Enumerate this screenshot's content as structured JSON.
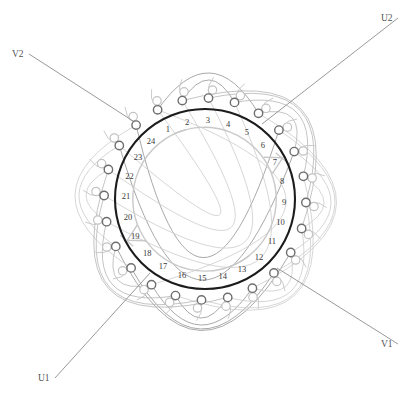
{
  "diagram": {
    "type": "winding-diagram",
    "slot_count": 24,
    "geometry": {
      "center_x": 205,
      "center_y": 199,
      "stator_radius": 90,
      "bore_radius": 72,
      "node_radius_outer": 101,
      "node_dot_r": 4.2
    },
    "colors": {
      "stator_ring": "#1c1c1c",
      "bore_ring": "#c9c9c9",
      "phase_u": "#9a9a9a",
      "phase_v": "#b9b9b9",
      "phase_w": "#cfcfcf",
      "node_dark": "#6e6e6e",
      "node_light": "#c4c4c4",
      "label_text": "#3a3a3a",
      "terminal_text": "#555555",
      "background": "#ffffff"
    },
    "slot_numbers": [
      "1",
      "2",
      "3",
      "4",
      "5",
      "6",
      "7",
      "8",
      "9",
      "10",
      "11",
      "12",
      "13",
      "14",
      "15",
      "16",
      "17",
      "18",
      "19",
      "20",
      "21",
      "22",
      "23",
      "24"
    ],
    "terminals": [
      {
        "id": "V2",
        "label": "V2",
        "x": 12,
        "y": 52,
        "anchor_x": 133,
        "anchor_y": 121,
        "text_anchor": "start"
      },
      {
        "id": "U2",
        "label": "U2",
        "x": 381,
        "y": 16,
        "anchor_x": 262,
        "anchor_y": 124,
        "text_anchor": "start"
      },
      {
        "id": "V1",
        "label": "V1",
        "x": 381,
        "y": 342,
        "anchor_x": 277,
        "anchor_y": 268,
        "text_anchor": "start"
      },
      {
        "id": "U1",
        "label": "U1",
        "x": 38,
        "y": 376,
        "anchor_x": 150,
        "anchor_y": 273,
        "text_anchor": "start"
      }
    ],
    "phases": [
      {
        "name": "U",
        "terminal_start": "U1",
        "terminal_end": "U2",
        "color": "#9a9a9a"
      },
      {
        "name": "V",
        "terminal_start": "V1",
        "terminal_end": "V2",
        "color": "#b9b9b9"
      },
      {
        "name": "W",
        "terminal_start": "",
        "terminal_end": "",
        "color": "#cfcfcf"
      }
    ],
    "bore_notches": [
      {
        "name": "notch-top-right",
        "at_slot": 13
      },
      {
        "name": "notch-bottom-left",
        "at_slot": 1
      }
    ]
  }
}
